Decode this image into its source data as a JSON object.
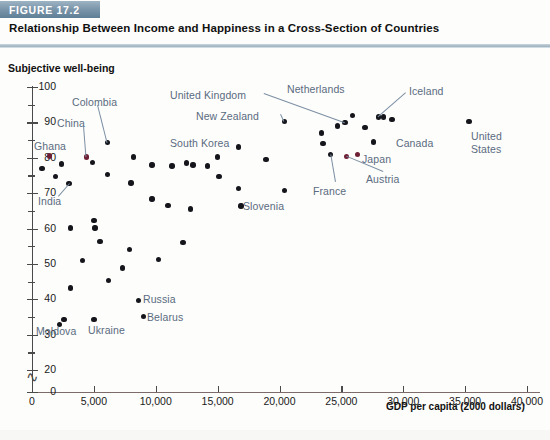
{
  "figure": {
    "badge": "FIGURE 17.2",
    "title": "Relationship Between Income and Happiness in a Cross-Section of Countries"
  },
  "colors": {
    "badge_bg": "#7d97ab",
    "point": "#15151c",
    "point_highlight": "#6e1f34",
    "annotation_text": "#5a6b80",
    "axis": "#4a4a4a"
  },
  "chart_data": {
    "type": "scatter",
    "title": "Relationship Between Income and Happiness in a Cross-Section of Countries",
    "xlabel": "GDP per capita (2000 dollars)",
    "ylabel": "Subjective well-being",
    "xlim": [
      0,
      40000
    ],
    "ylim": [
      0,
      100
    ],
    "y_axis_break": "between 0 and 20",
    "grid": false,
    "legend": null,
    "xticks": [
      0,
      5000,
      10000,
      15000,
      20000,
      25000,
      30000,
      35000,
      40000
    ],
    "xticklabels": [
      "0",
      "5,000",
      "10,000",
      "15,000",
      "20,000",
      "25,000",
      "30,000",
      "35,000",
      "40,000"
    ],
    "yticks": [
      0,
      20,
      30,
      40,
      50,
      60,
      70,
      80,
      90,
      100
    ],
    "yticklabels": [
      "0",
      "20",
      "30",
      "40",
      "50",
      "60",
      "70",
      "80",
      "90",
      "100"
    ],
    "yticks_minor": [
      25,
      35,
      45,
      55,
      65,
      75,
      85,
      95
    ],
    "points": [
      {
        "label": "Ghana",
        "x": 1400,
        "y": 80.5,
        "highlight": true
      },
      {
        "label": null,
        "x": 800,
        "y": 77.0,
        "highlight": false
      },
      {
        "label": null,
        "x": 2400,
        "y": 78.2,
        "highlight": false
      },
      {
        "label": null,
        "x": 1900,
        "y": 74.7,
        "highlight": false
      },
      {
        "label": "India",
        "x": 3000,
        "y": 72.8,
        "highlight": false
      },
      {
        "label": null,
        "x": 2600,
        "y": 34.3,
        "highlight": false
      },
      {
        "label": "Moldova",
        "x": 2200,
        "y": 32.8,
        "highlight": false
      },
      {
        "label": null,
        "x": 3100,
        "y": 43.2,
        "highlight": false
      },
      {
        "label": null,
        "x": 3100,
        "y": 60.1,
        "highlight": false
      },
      {
        "label": null,
        "x": 4100,
        "y": 51.0,
        "highlight": false
      },
      {
        "label": "China",
        "x": 4400,
        "y": 80.2,
        "highlight": true
      },
      {
        "label": null,
        "x": 4900,
        "y": 78.7,
        "highlight": false
      },
      {
        "label": null,
        "x": 5000,
        "y": 62.3,
        "highlight": false
      },
      {
        "label": null,
        "x": 5100,
        "y": 60.1,
        "highlight": false
      },
      {
        "label": "Ukraine",
        "x": 5000,
        "y": 34.3,
        "highlight": false
      },
      {
        "label": null,
        "x": 5500,
        "y": 56.4,
        "highlight": false
      },
      {
        "label": "Colombia",
        "x": 6100,
        "y": 84.3,
        "highlight": false
      },
      {
        "label": null,
        "x": 6100,
        "y": 75.2,
        "highlight": false
      },
      {
        "label": null,
        "x": 6200,
        "y": 45.3,
        "highlight": false
      },
      {
        "label": null,
        "x": 7300,
        "y": 48.8,
        "highlight": false
      },
      {
        "label": null,
        "x": 7900,
        "y": 54.0,
        "highlight": false
      },
      {
        "label": null,
        "x": 8200,
        "y": 80.2,
        "highlight": false
      },
      {
        "label": null,
        "x": 8000,
        "y": 72.9,
        "highlight": false
      },
      {
        "label": "Russia",
        "x": 8600,
        "y": 39.7,
        "highlight": false
      },
      {
        "label": "Belarus",
        "x": 9000,
        "y": 35.2,
        "highlight": false
      },
      {
        "label": null,
        "x": 9700,
        "y": 78.0,
        "highlight": false
      },
      {
        "label": null,
        "x": 9700,
        "y": 68.3,
        "highlight": false
      },
      {
        "label": null,
        "x": 10200,
        "y": 51.3,
        "highlight": false
      },
      {
        "label": null,
        "x": 11300,
        "y": 77.7,
        "highlight": false
      },
      {
        "label": null,
        "x": 11000,
        "y": 66.5,
        "highlight": false
      },
      {
        "label": null,
        "x": 12200,
        "y": 56.0,
        "highlight": false
      },
      {
        "label": null,
        "x": 12500,
        "y": 78.5,
        "highlight": false
      },
      {
        "label": null,
        "x": 13000,
        "y": 78.0,
        "highlight": false
      },
      {
        "label": null,
        "x": 12800,
        "y": 65.5,
        "highlight": false
      },
      {
        "label": null,
        "x": 14200,
        "y": 77.7,
        "highlight": false
      },
      {
        "label": "South Korea",
        "x": 15000,
        "y": 80.2,
        "highlight": false
      },
      {
        "label": null,
        "x": 15100,
        "y": 74.7,
        "highlight": false
      },
      {
        "label": null,
        "x": 16700,
        "y": 83.0,
        "highlight": false
      },
      {
        "label": null,
        "x": 16700,
        "y": 71.3,
        "highlight": false
      },
      {
        "label": "Slovenia",
        "x": 16900,
        "y": 66.4,
        "highlight": false
      },
      {
        "label": null,
        "x": 18900,
        "y": 79.5,
        "highlight": false
      },
      {
        "label": "New Zealand",
        "x": 20400,
        "y": 90.2,
        "highlight": false
      },
      {
        "label": null,
        "x": 20400,
        "y": 70.8,
        "highlight": false
      },
      {
        "label": null,
        "x": 23400,
        "y": 87.0,
        "highlight": false
      },
      {
        "label": null,
        "x": 23500,
        "y": 84.0,
        "highlight": false
      },
      {
        "label": "France",
        "x": 24100,
        "y": 81.0,
        "highlight": false
      },
      {
        "label": null,
        "x": 24700,
        "y": 89.0,
        "highlight": false
      },
      {
        "label": "United Kingdom",
        "x": 25300,
        "y": 90.0,
        "highlight": false
      },
      {
        "label": "Austria",
        "x": 25400,
        "y": 80.3,
        "highlight": true
      },
      {
        "label": "Netherlands",
        "x": 25900,
        "y": 92.0,
        "highlight": false
      },
      {
        "label": "Japan",
        "x": 26300,
        "y": 81.0,
        "highlight": true
      },
      {
        "label": null,
        "x": 26900,
        "y": 88.5,
        "highlight": false
      },
      {
        "label": "Iceland",
        "x": 28000,
        "y": 91.5,
        "highlight": false
      },
      {
        "label": null,
        "x": 28400,
        "y": 91.5,
        "highlight": false
      },
      {
        "label": null,
        "x": 29100,
        "y": 90.8,
        "highlight": false
      },
      {
        "label": "Canada",
        "x": 27600,
        "y": 84.5,
        "highlight": false
      },
      {
        "label": "United States",
        "x": 35300,
        "y": 90.3,
        "highlight": false
      }
    ],
    "annotations": [
      {
        "text": "Subjective well-being",
        "kind": "axis-title"
      },
      {
        "text": "GDP per capita (2000 dollars)",
        "kind": "axis-title"
      }
    ]
  }
}
